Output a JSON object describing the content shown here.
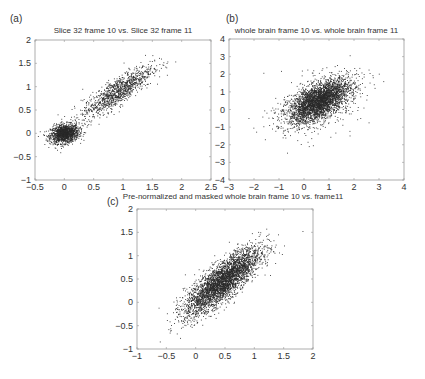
{
  "chart_data": [
    {
      "type": "scatter",
      "panel_label": "(a)",
      "title": "Slice 32 frame 10 vs. Slice 32 frame 11",
      "xlabel": "",
      "ylabel": "",
      "xlim": [
        -0.5,
        2.5
      ],
      "ylim": [
        -1,
        2
      ],
      "xticks": [
        -0.5,
        0,
        0.5,
        1,
        1.5,
        2,
        2.5
      ],
      "yticks": [
        -1,
        -0.5,
        0,
        0.5,
        1,
        1.5,
        2
      ],
      "xtick_labels": [
        "-0.5",
        "0",
        "0.5",
        "1",
        "1.5",
        "2",
        "2.5"
      ],
      "ytick_labels": [
        "-1",
        "-0.5",
        "0",
        "0.5",
        "1",
        "1.5",
        "2"
      ],
      "grid": false,
      "clusters": [
        {
          "cx": 0.0,
          "cy": 0.0,
          "sx": 0.12,
          "sy": 0.1,
          "rho": 0.2,
          "n": 1400
        },
        {
          "cx": 0.9,
          "cy": 0.9,
          "sx": 0.3,
          "sy": 0.28,
          "rho": 0.85,
          "n": 1100
        }
      ]
    },
    {
      "type": "scatter",
      "panel_label": "(b)",
      "title": "whole brain frame 10 vs. whole brain frame 11",
      "xlabel": "",
      "ylabel": "",
      "xlim": [
        -3,
        4
      ],
      "ylim": [
        -4,
        4
      ],
      "xticks": [
        -3,
        -2,
        -1,
        0,
        1,
        2,
        3,
        4
      ],
      "yticks": [
        -4,
        -3,
        -2,
        -1,
        0,
        1,
        2,
        3,
        4
      ],
      "xtick_labels": [
        "-3",
        "-2",
        "-1",
        "0",
        "1",
        "2",
        "3",
        "4"
      ],
      "ytick_labels": [
        "-4",
        "-3",
        "-2",
        "-1",
        "0",
        "1",
        "2",
        "3",
        "4"
      ],
      "grid": false,
      "clusters": [
        {
          "cx": 0.6,
          "cy": 0.5,
          "sx": 0.6,
          "sy": 0.6,
          "rho": 0.6,
          "n": 3000
        },
        {
          "cx": 0.5,
          "cy": 0.3,
          "sx": 0.9,
          "sy": 0.9,
          "rho": 0.4,
          "n": 500
        }
      ]
    },
    {
      "type": "scatter",
      "panel_label": "(c)",
      "title": "Pre-normalized and masked whole brain frame 10 vs. frame11",
      "xlabel": "",
      "ylabel": "",
      "xlim": [
        -1,
        2
      ],
      "ylim": [
        -1,
        2
      ],
      "xticks": [
        -1,
        -0.5,
        0,
        0.5,
        1,
        1.5,
        2
      ],
      "yticks": [
        -1,
        -0.5,
        0,
        0.5,
        1,
        1.5,
        2
      ],
      "xtick_labels": [
        "-1",
        "-0.5",
        "0",
        "0.5",
        "1",
        "1.5",
        "2"
      ],
      "ytick_labels": [
        "-1",
        "-0.5",
        "0",
        "0.5",
        "1",
        "1.5",
        "2"
      ],
      "grid": false,
      "clusters": [
        {
          "cx": 0.45,
          "cy": 0.45,
          "sx": 0.32,
          "sy": 0.36,
          "rho": 0.82,
          "n": 3500
        }
      ]
    }
  ],
  "colors": {
    "points": "#2a2a2a",
    "axis": "#999999",
    "text": "#333333"
  }
}
